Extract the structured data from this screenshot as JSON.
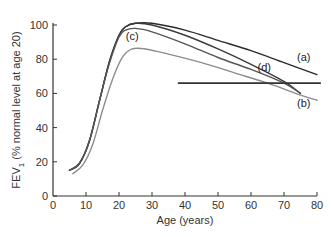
{
  "chart_data": {
    "type": "line",
    "title": "",
    "xlabel": "Age (years)",
    "ylabel": "FEV1 (% normal level at age 20)",
    "ylabel_main": "FEV",
    "ylabel_sub": "1",
    "ylabel_rest": " (% normal level at age 20)",
    "xlim": [
      0,
      80
    ],
    "ylim": [
      0,
      100
    ],
    "x_ticks": [
      0,
      10,
      20,
      30,
      40,
      50,
      60,
      70,
      80
    ],
    "y_ticks": [
      0,
      20,
      40,
      60,
      80,
      100
    ],
    "grid": false,
    "legend": "none (curves labelled inline)",
    "series": [
      {
        "name": "(a)",
        "color": "#2b2b2b",
        "points": [
          [
            5,
            15
          ],
          [
            8,
            19
          ],
          [
            11,
            32
          ],
          [
            14,
            55
          ],
          [
            17,
            78
          ],
          [
            20,
            94
          ],
          [
            22,
            99
          ],
          [
            25,
            101
          ],
          [
            30,
            101
          ],
          [
            40,
            97
          ],
          [
            50,
            91
          ],
          [
            60,
            85
          ],
          [
            70,
            78
          ],
          [
            80,
            71
          ]
        ]
      },
      {
        "name": "(d)",
        "color": "#3a3a3a",
        "points": [
          [
            5,
            15
          ],
          [
            8,
            19
          ],
          [
            11,
            32
          ],
          [
            14,
            55
          ],
          [
            17,
            78
          ],
          [
            20,
            94
          ],
          [
            22,
            99
          ],
          [
            25,
            101
          ],
          [
            30,
            100
          ],
          [
            40,
            94
          ],
          [
            50,
            86
          ],
          [
            60,
            77
          ],
          [
            70,
            67
          ],
          [
            75,
            60
          ]
        ]
      },
      {
        "name": "(c)",
        "color": "#555555",
        "points": [
          [
            5,
            15
          ],
          [
            8,
            19
          ],
          [
            11,
            32
          ],
          [
            14,
            55
          ],
          [
            17,
            77
          ],
          [
            20,
            93
          ],
          [
            22,
            97
          ],
          [
            25,
            98
          ],
          [
            30,
            96
          ],
          [
            40,
            89
          ],
          [
            50,
            81
          ],
          [
            60,
            74
          ],
          [
            70,
            66
          ],
          [
            75,
            60
          ]
        ]
      },
      {
        "name": "(b)",
        "color": "#8c8c8c",
        "points": [
          [
            6,
            13
          ],
          [
            9,
            18
          ],
          [
            12,
            30
          ],
          [
            15,
            50
          ],
          [
            18,
            68
          ],
          [
            21,
            81
          ],
          [
            24,
            86
          ],
          [
            28,
            86
          ],
          [
            35,
            83
          ],
          [
            45,
            78
          ],
          [
            55,
            72
          ],
          [
            65,
            66
          ],
          [
            75,
            59
          ],
          [
            80,
            56
          ]
        ]
      },
      {
        "name": "threshold",
        "color": "#333333",
        "points": [
          [
            38,
            66
          ],
          [
            81,
            66
          ]
        ]
      }
    ],
    "annotations": [
      {
        "text": "(a)",
        "x": 76,
        "y": 79
      },
      {
        "text": "(b)",
        "x": 76,
        "y": 52
      },
      {
        "text": "(c)",
        "x": 24,
        "y": 91
      },
      {
        "text": "(d)",
        "x": 64,
        "y": 73
      }
    ]
  }
}
